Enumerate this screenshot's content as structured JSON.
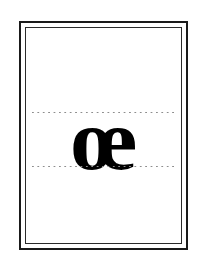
{
  "card": {
    "type": "handwriting-practice-card",
    "background_color": "#ffffff",
    "border": {
      "outer_color": "#1a1a1a",
      "outer_width_px": 2,
      "inner_color": "#2a2a2a",
      "inner_width_px": 1,
      "gap_px": 4
    },
    "guidelines": {
      "style": "dotted",
      "color": "#8d8d8d",
      "count": 2,
      "labels": [
        "x-height-top-guide",
        "baseline-guide"
      ]
    },
    "glyph": {
      "character": "œ",
      "name": "latin-small-ligature-oe",
      "plain_name": "oe ligature",
      "color": "#000000",
      "weight": "bold",
      "style": "serif"
    }
  }
}
